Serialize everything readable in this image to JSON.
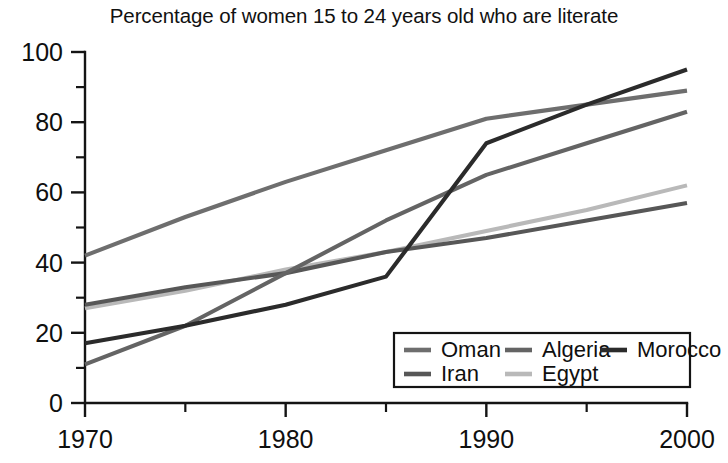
{
  "chart_data": {
    "type": "line",
    "title": "Percentage of women 15 to 24 years old who are literate",
    "xlabel": "",
    "ylabel": "",
    "xlim": [
      1970,
      2000
    ],
    "ylim": [
      0,
      100
    ],
    "x_ticks": [
      1970,
      1980,
      1990,
      2000
    ],
    "x_minor_ticks": [
      1975,
      1985,
      1995
    ],
    "y_ticks": [
      0,
      20,
      40,
      60,
      80,
      100
    ],
    "y_minor_ticks": [
      10,
      30,
      50,
      70,
      90
    ],
    "grid": false,
    "legend_position": "bottom-right",
    "x": [
      1970,
      1975,
      1980,
      1985,
      1990,
      1995,
      2000
    ],
    "series": [
      {
        "name": "Oman",
        "color": "#6e6e6e",
        "values": [
          42,
          53,
          63,
          72,
          81,
          85,
          89
        ]
      },
      {
        "name": "Algeria",
        "color": "#646464",
        "values": [
          11,
          22,
          37,
          52,
          65,
          74,
          83
        ]
      },
      {
        "name": "Morocco",
        "color": "#2b2b2b",
        "values": [
          17,
          22,
          28,
          36,
          74,
          85,
          95
        ]
      },
      {
        "name": "Iran",
        "color": "#575757",
        "values": [
          28,
          33,
          37,
          43,
          47,
          52,
          57
        ]
      },
      {
        "name": "Egypt",
        "color": "#b9b9b9",
        "values": [
          27,
          32,
          38,
          43,
          49,
          55,
          62
        ]
      }
    ]
  },
  "chart": {
    "title": "Percentage of women 15 to 24 years old who are literate",
    "y_tick_labels": [
      "0",
      "20",
      "40",
      "60",
      "80",
      "100"
    ],
    "x_tick_labels": [
      "1970",
      "1980",
      "1990",
      "2000"
    ],
    "legend": {
      "entries": [
        {
          "label": "Oman",
          "color": "#6e6e6e"
        },
        {
          "label": "Algeria",
          "color": "#646464"
        },
        {
          "label": "Morocco",
          "color": "#2b2b2b"
        },
        {
          "label": "Iran",
          "color": "#575757"
        },
        {
          "label": "Egypt",
          "color": "#b9b9b9"
        }
      ]
    }
  }
}
